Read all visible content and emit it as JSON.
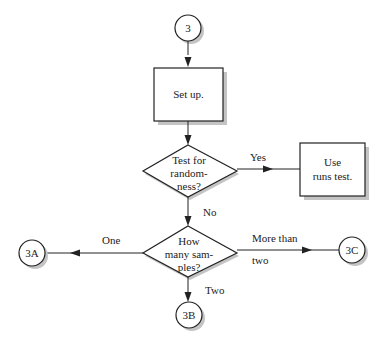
{
  "diagram": {
    "type": "flowchart",
    "colors": {
      "stroke": "#222222",
      "shadow": "#bdbdbd",
      "fill": "#ffffff",
      "background": "#ffffff"
    },
    "nodes": {
      "start": {
        "shape": "circle",
        "label": "3"
      },
      "setup": {
        "shape": "box",
        "label": "Set up."
      },
      "test_randomness": {
        "shape": "diamond",
        "lines": [
          "Test for",
          "random-",
          "ness?"
        ]
      },
      "runs_test": {
        "shape": "box",
        "lines": [
          "Use",
          "runs test."
        ]
      },
      "how_many": {
        "shape": "diamond",
        "lines": [
          "How",
          "many sam-",
          "ples?"
        ]
      },
      "c3a": {
        "shape": "circle",
        "label": "3A"
      },
      "c3b": {
        "shape": "circle",
        "label": "3B"
      },
      "c3c": {
        "shape": "circle",
        "label": "3C"
      }
    },
    "edges": {
      "yes": {
        "from": "test_randomness",
        "to": "runs_test",
        "label": "Yes"
      },
      "no": {
        "from": "test_randomness",
        "to": "how_many",
        "label": "No"
      },
      "one": {
        "from": "how_many",
        "to": "c3a",
        "label": "One"
      },
      "two": {
        "from": "how_many",
        "to": "c3b",
        "label": "Two"
      },
      "more": {
        "from": "how_many",
        "to": "c3c",
        "label_line1": "More than",
        "label_line2": "two"
      }
    }
  }
}
